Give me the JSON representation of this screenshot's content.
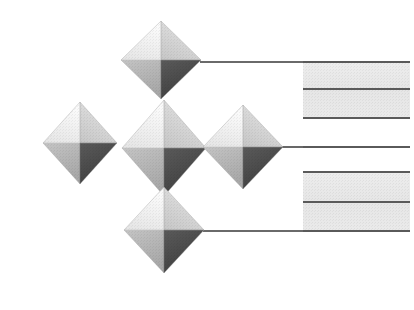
{
  "figure": {
    "title": "Isometric Diamond Network Diagram",
    "width": 414,
    "height": 310,
    "background_color": "#ffffff",
    "style": "grayscale halftone / scanned print"
  },
  "palette": {
    "background": "#ffffff",
    "facet_top_left": "#f4f4f4",
    "facet_top_right": "#d6d6d6",
    "facet_bottom_left": "#b6b6b6",
    "facet_bottom_right": "#4c4c4c",
    "facet_edge": "#9a9a9a",
    "band_fill": "#e9e9e9",
    "rule_line": "#5a5a5a",
    "connector_line": "#6a6a6a"
  },
  "nodes": [
    {
      "id": "node-top",
      "label": "top-diamond",
      "center_x": 161,
      "center_y": 60,
      "half_width": 40,
      "half_height": 39,
      "row": "top"
    },
    {
      "id": "node-mid-left",
      "label": "middle-left-diamond",
      "center_x": 80,
      "center_y": 143,
      "half_width": 37,
      "half_height": 41,
      "row": "middle"
    },
    {
      "id": "node-mid-center",
      "label": "middle-center-diamond",
      "center_x": 164,
      "center_y": 148,
      "half_width": 42,
      "half_height": 48,
      "row": "middle"
    },
    {
      "id": "node-mid-right",
      "label": "middle-right-diamond",
      "center_x": 243,
      "center_y": 147,
      "half_width": 40,
      "half_height": 42,
      "row": "middle"
    },
    {
      "id": "node-bottom",
      "label": "bottom-diamond",
      "center_x": 164,
      "center_y": 230,
      "half_width": 40,
      "half_height": 43,
      "row": "bottom"
    }
  ],
  "connectors": [
    {
      "id": "connector-top",
      "from_node": "node-top",
      "x1": 200,
      "y1": 62,
      "x2": 410,
      "y2": 62
    },
    {
      "id": "connector-middle",
      "from_node": "node-mid-right",
      "x1": 282,
      "y1": 147,
      "x2": 410,
      "y2": 147
    },
    {
      "id": "connector-bottom",
      "from_node": "node-bottom",
      "x1": 203,
      "y1": 231,
      "x2": 410,
      "y2": 231
    }
  ],
  "bands": [
    {
      "id": "band-upper",
      "label": "upper-gray-band",
      "x": 303,
      "y": 62,
      "width": 107,
      "height": 57
    },
    {
      "id": "band-lower",
      "label": "lower-gray-band",
      "x": 303,
      "y": 172,
      "width": 107,
      "height": 59
    }
  ],
  "rules": [
    {
      "id": "rule-1",
      "label": "rule-line-1",
      "x1": 303,
      "x2": 410,
      "y": 62,
      "full_width": true,
      "start_x": 200
    },
    {
      "id": "rule-2",
      "label": "rule-line-2",
      "x1": 303,
      "x2": 410,
      "y": 89,
      "full_width": false,
      "start_x": 303
    },
    {
      "id": "rule-3",
      "label": "rule-line-3",
      "x1": 303,
      "x2": 410,
      "y": 118,
      "full_width": false,
      "start_x": 303
    },
    {
      "id": "rule-4",
      "label": "rule-line-4",
      "x1": 303,
      "x2": 410,
      "y": 147,
      "full_width": true,
      "start_x": 282
    },
    {
      "id": "rule-5",
      "label": "rule-line-5",
      "x1": 303,
      "x2": 410,
      "y": 172,
      "full_width": false,
      "start_x": 303
    },
    {
      "id": "rule-6",
      "label": "rule-line-6",
      "x1": 303,
      "x2": 410,
      "y": 202,
      "full_width": false,
      "start_x": 303
    },
    {
      "id": "rule-7",
      "label": "rule-line-7",
      "x1": 303,
      "x2": 410,
      "y": 231,
      "full_width": true,
      "start_x": 203
    }
  ]
}
